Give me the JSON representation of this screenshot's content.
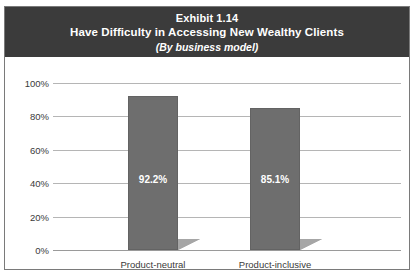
{
  "exhibit": {
    "title_number": "Exhibit 1.14",
    "title_main": "Have Difficulty in Accessing New Wealthy Clients",
    "title_sub": "(By business model)"
  },
  "colors": {
    "header_background": "#3b3b3b",
    "header_text": "#ffffff",
    "bar_fill": "#6e6e6e",
    "bar_shadow": "#a6a6a6",
    "gridline": "#b5b5b5",
    "axis_text": "#3a3a3a",
    "border": "#7a7a7a",
    "value_label": "#ffffff"
  },
  "chart_data": {
    "type": "bar",
    "title": "Exhibit 1.14 Have Difficulty in Accessing New Wealthy Clients",
    "subtitle": "(By business model)",
    "categories": [
      "Product-neutral",
      "Product-inclusive"
    ],
    "values": [
      92.2,
      85.1
    ],
    "value_labels": [
      "92.2%",
      "85.1%"
    ],
    "xlabel": "",
    "ylabel": "",
    "ylim": [
      0,
      100
    ],
    "yticks": [
      0,
      20,
      40,
      60,
      80,
      100
    ],
    "ytick_labels": [
      "0%",
      "20%",
      "40%",
      "60%",
      "80%",
      "100%"
    ],
    "grid": true,
    "legend": false,
    "legend_position": "none"
  }
}
